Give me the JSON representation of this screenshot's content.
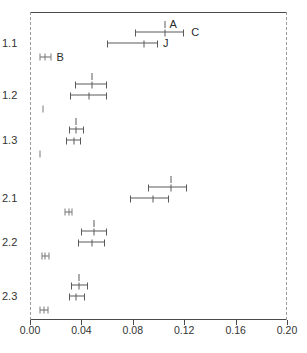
{
  "chart_data": {
    "type": "scatter",
    "title": "",
    "xlabel": "",
    "ylabel": "",
    "xlim": [
      0.0,
      0.2
    ],
    "grid": false,
    "legend_position": "none",
    "xticks": [
      "0.00",
      "0.04",
      "0.08",
      "0.12",
      "0.16",
      "0.20"
    ],
    "xtick_values": [
      0.0,
      0.04,
      0.08,
      0.12,
      0.16,
      0.2
    ],
    "yticks": [
      "1.1",
      "1.2",
      "1.3",
      "2.1",
      "2.2",
      "2.3"
    ],
    "ytick_values": [
      "1.1",
      "1.2",
      "1.3",
      "2.1",
      "2.2",
      "2.3"
    ],
    "annotations": [
      {
        "text": "A",
        "x": 0.107,
        "row": "1.1",
        "offset": "upper"
      },
      {
        "text": "C",
        "x": 0.124,
        "row": "1.1",
        "offset": "mid"
      },
      {
        "text": "J",
        "x": 0.102,
        "row": "1.1",
        "offset": "lower"
      },
      {
        "text": "B",
        "x": 0.019,
        "row": "1.1",
        "offset": "marker"
      }
    ],
    "rows": [
      {
        "category": "1.1",
        "upper": {
          "x": 0.105,
          "low": 0.082,
          "high": 0.12,
          "label": "A"
        },
        "lower": {
          "x": 0.089,
          "low": 0.06,
          "high": 0.1,
          "label": "J"
        },
        "marker": {
          "x": 0.012,
          "low": 0.008,
          "high": 0.016,
          "label": "B"
        }
      },
      {
        "category": "1.2",
        "upper": {
          "x": 0.048,
          "low": 0.035,
          "high": 0.06,
          "label": ""
        },
        "lower": {
          "x": 0.046,
          "low": 0.031,
          "high": 0.06,
          "label": ""
        },
        "marker": {
          "x": 0.01,
          "low": 0.01,
          "high": 0.01,
          "label": ""
        }
      },
      {
        "category": "1.3",
        "upper": {
          "x": 0.036,
          "low": 0.03,
          "high": 0.042,
          "label": ""
        },
        "lower": {
          "x": 0.034,
          "low": 0.028,
          "high": 0.04,
          "label": ""
        },
        "marker": {
          "x": 0.008,
          "low": 0.008,
          "high": 0.008,
          "label": ""
        }
      },
      {
        "category": "2.1",
        "upper": {
          "x": 0.11,
          "low": 0.092,
          "high": 0.122,
          "label": ""
        },
        "lower": {
          "x": 0.096,
          "low": 0.078,
          "high": 0.108,
          "label": ""
        },
        "marker": {
          "x": 0.03,
          "low": 0.027,
          "high": 0.033,
          "label": ""
        }
      },
      {
        "category": "2.2",
        "upper": {
          "x": 0.05,
          "low": 0.04,
          "high": 0.06,
          "label": ""
        },
        "lower": {
          "x": 0.048,
          "low": 0.037,
          "high": 0.058,
          "label": ""
        },
        "marker": {
          "x": 0.012,
          "low": 0.009,
          "high": 0.015,
          "label": ""
        }
      },
      {
        "category": "2.3",
        "upper": {
          "x": 0.038,
          "low": 0.032,
          "high": 0.045,
          "label": ""
        },
        "lower": {
          "x": 0.036,
          "low": 0.03,
          "high": 0.043,
          "label": ""
        },
        "marker": {
          "x": 0.011,
          "low": 0.008,
          "high": 0.014,
          "label": ""
        }
      }
    ]
  },
  "style": {
    "line_color": "#5a5a5a",
    "frame_color": "#4a4a4a",
    "dash_color": "#9a9a9a",
    "text_color": "#333333",
    "background": "#ffffff"
  }
}
